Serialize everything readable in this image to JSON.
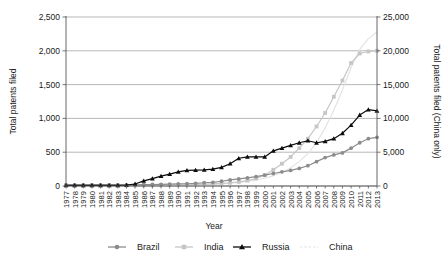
{
  "chart_data": {
    "type": "line",
    "title": "",
    "xlabel": "Year",
    "ylabel": "Total patents filed",
    "y2label": "Total patents filed (China only)",
    "grid": true,
    "legend_position": "bottom",
    "ylim": [
      0,
      2500
    ],
    "y2lim": [
      0,
      25000
    ],
    "yticks": [
      "0",
      "500",
      "1,000",
      "1,500",
      "2,000",
      "2,500"
    ],
    "ytick_values": [
      0,
      500,
      1000,
      1500,
      2000,
      2500
    ],
    "y2ticks": [
      "0",
      "5,000",
      "10,000",
      "15,000",
      "20,000",
      "25,000"
    ],
    "y2tick_values": [
      0,
      5000,
      10000,
      15000,
      20000,
      25000
    ],
    "categories": [
      "1977",
      "1978",
      "1979",
      "1980",
      "1981",
      "1982",
      "1983",
      "1984",
      "1985",
      "1986",
      "1987",
      "1988",
      "1989",
      "1990",
      "1991",
      "1992",
      "1993",
      "1994",
      "1995",
      "1996",
      "1997",
      "1998",
      "1999",
      "2000",
      "2001",
      "2002",
      "2003",
      "2004",
      "2005",
      "2006",
      "2007",
      "2008",
      "2009",
      "2010",
      "2011",
      "2012",
      "2013"
    ],
    "series": [
      {
        "name": "Brazil",
        "color": "#8c8c8c",
        "marker": "circle",
        "axis": "left",
        "values": [
          18,
          18,
          18,
          18,
          18,
          18,
          18,
          18,
          18,
          20,
          22,
          25,
          28,
          30,
          33,
          40,
          48,
          55,
          70,
          90,
          105,
          120,
          140,
          160,
          185,
          210,
          230,
          260,
          300,
          360,
          420,
          460,
          490,
          560,
          640,
          700,
          720
        ]
      },
      {
        "name": "India",
        "color": "#c6c6c6",
        "marker": "square",
        "axis": "left",
        "values": [
          8,
          8,
          8,
          8,
          8,
          8,
          8,
          8,
          8,
          9,
          10,
          12,
          14,
          16,
          18,
          20,
          24,
          30,
          38,
          48,
          60,
          80,
          110,
          160,
          240,
          330,
          430,
          560,
          700,
          880,
          1080,
          1320,
          1560,
          1820,
          1960,
          1990,
          2000
        ]
      },
      {
        "name": "Russia",
        "color": "#0d0d0d",
        "marker": "triangle",
        "axis": "left",
        "values": [
          10,
          10,
          10,
          10,
          10,
          10,
          10,
          12,
          30,
          75,
          110,
          145,
          175,
          210,
          230,
          235,
          240,
          250,
          275,
          330,
          410,
          430,
          430,
          430,
          520,
          560,
          600,
          640,
          670,
          640,
          660,
          700,
          780,
          900,
          1050,
          1130,
          1110
        ]
      },
      {
        "name": "China",
        "color": "#e2e2e2",
        "marker": "none",
        "axis": "right",
        "values": [
          20,
          20,
          20,
          20,
          20,
          20,
          20,
          20,
          20,
          30,
          40,
          55,
          70,
          90,
          110,
          140,
          180,
          230,
          300,
          400,
          520,
          680,
          880,
          1150,
          1500,
          2000,
          2700,
          3600,
          4800,
          6400,
          8600,
          11200,
          14200,
          17500,
          20200,
          21800,
          22800
        ]
      }
    ]
  },
  "legend": {
    "entries": [
      {
        "label": "Brazil"
      },
      {
        "label": "India"
      },
      {
        "label": "Russia"
      },
      {
        "label": "China"
      }
    ]
  }
}
